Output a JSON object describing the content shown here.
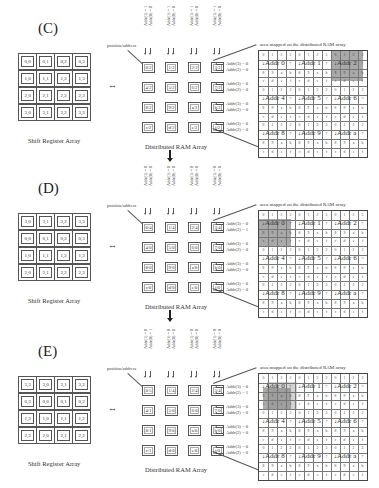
{
  "panels": [
    {
      "id": "C",
      "label": "(C)",
      "shift_register": {
        "caption": "Shift Register Array",
        "cells": [
          [
            "0,0",
            "0,1",
            "0,2",
            "0,3"
          ],
          [
            "1,0",
            "1,1",
            "1,2",
            "1,3"
          ],
          [
            "2,0",
            "2,1",
            "2,2",
            "2,3"
          ],
          [
            "3,0",
            "3,1",
            "3,2",
            "3,3"
          ]
        ]
      },
      "arrow": "↔",
      "ram": {
        "caption": "Distributed RAM Array",
        "position_label": "position/address",
        "col_labels": [
          [
            "Addr(1) = 1",
            "Addr(0) = 0"
          ],
          [
            "Addr(1) = 1",
            "Addr(0) = 0"
          ],
          [
            "Addr(1) = 1",
            "Addr(0) = 0"
          ],
          [
            "Addr(1) = 1",
            "Addr(0) = 0"
          ]
        ],
        "cells": [
          [
            "0/2",
            "1/2",
            "2/2",
            "3/2"
          ],
          [
            "4/2",
            "5/2",
            "6/2",
            "7/2"
          ],
          [
            "8/2",
            "9/2",
            "a/2",
            "b/2"
          ],
          [
            "c/2",
            "d/2",
            "e/2",
            "f/2"
          ]
        ],
        "row_labels": [
          [
            "Addr(3) = 0",
            "Addr(2) = 0"
          ],
          [
            "Addr(3) = 0",
            "Addr(2) = 0"
          ],
          [
            "Addr(3) = 0",
            "Addr(2) = 0"
          ],
          [
            "Addr(3) = 0",
            "Addr(2) = 0"
          ]
        ]
      },
      "mapped": {
        "title": "area mapped on the distributed RAM array",
        "addr_labels": [
          "Addr 0",
          "Addr 1",
          "Addr 2",
          "Addr 4",
          "Addr 5",
          "Addr 6",
          "Addr 8",
          "Addr 9",
          "Addr a"
        ],
        "highlight": "Addr 2 block"
      }
    },
    {
      "id": "D",
      "label": "(D)",
      "shift_register": {
        "caption": "Shift Register Array",
        "cells": [
          [
            "3,0",
            "3,1",
            "3,2",
            "3,3"
          ],
          [
            "0,0",
            "0,1",
            "0,2",
            "0,3"
          ],
          [
            "1,0",
            "1,1",
            "1,2",
            "1,3"
          ],
          [
            "2,0",
            "2,1",
            "2,2",
            "2,3"
          ]
        ]
      },
      "arrow": "↔",
      "ram": {
        "caption": "Distributed RAM Array",
        "position_label": "position/address",
        "col_labels": [
          [
            "Addr(1) = 0",
            "Addr(0) = 0"
          ],
          [
            "Addr(1) = 0",
            "Addr(0) = 0"
          ],
          [
            "Addr(1) = 0",
            "Addr(0) = 0"
          ],
          [
            "Addr(1) = 0",
            "Addr(0) = 0"
          ]
        ],
        "cells": [
          [
            "0/4",
            "1/4",
            "2/4",
            "3/4"
          ],
          [
            "4/0",
            "5/0",
            "6/0",
            "7/0"
          ],
          [
            "8/0",
            "9/0",
            "a/0",
            "b/0"
          ],
          [
            "c/0",
            "d/0",
            "e/0",
            "f/0"
          ]
        ],
        "row_labels": [
          [
            "Addr(3) = 0",
            "Addr(2) = 1"
          ],
          [
            "Addr(3) = 0",
            "Addr(2) = 0"
          ],
          [
            "Addr(3) = 0",
            "Addr(2) = 0"
          ],
          [
            "Addr(3) = 0",
            "Addr(2) = 0"
          ]
        ]
      },
      "mapped": {
        "title": "area mapped on the distributed RAM array",
        "addr_labels": [
          "Addr 0",
          "Addr 1",
          "Addr 2",
          "Addr 4",
          "Addr 5",
          "Addr 6",
          "Addr 8",
          "Addr 9",
          "Addr a"
        ],
        "highlight": "Addr 0 block shifted down"
      }
    },
    {
      "id": "E",
      "label": "(E)",
      "shift_register": {
        "caption": "Shift Register Array",
        "cells": [
          [
            "3,3",
            "3,0",
            "3,1",
            "3,2"
          ],
          [
            "0,3",
            "0,0",
            "0,1",
            "0,2"
          ],
          [
            "1,3",
            "1,0",
            "1,1",
            "1,2"
          ],
          [
            "2,3",
            "2,0",
            "2,1",
            "2,2"
          ]
        ]
      },
      "arrow": "↔",
      "ram": {
        "caption": "Distributed RAM Array",
        "position_label": "position/address",
        "col_labels": [
          [
            "Addr(1) = 0",
            "Addr(0) = 1"
          ],
          [
            "Addr(1) = 0",
            "Addr(0) = 0"
          ],
          [
            "Addr(1) = 0",
            "Addr(0) = 0"
          ],
          [
            "Addr(1) = 0",
            "Addr(0) = 0"
          ]
        ],
        "cells": [
          [
            "0/5",
            "1/4",
            "2/4",
            "3/4"
          ],
          [
            "4/1",
            "5/0",
            "6/0",
            "7/0"
          ],
          [
            "8/1",
            "9/0",
            "a/0",
            "b/0"
          ],
          [
            "c/1",
            "d/0",
            "e/0",
            "f/0"
          ]
        ],
        "row_labels": [
          [
            "Addr(3) = 0",
            "Addr(2) = 1"
          ],
          [
            "Addr(3) = 0",
            "Addr(2) = 0"
          ],
          [
            "Addr(3) = 0",
            "Addr(2) = 0"
          ],
          [
            "Addr(3) = 0",
            "Addr(2) = 0"
          ]
        ]
      },
      "mapped": {
        "title": "area mapped on the distributed RAM array",
        "addr_labels": [
          "Addr 0",
          "Addr 1",
          "Addr 2",
          "Addr 4",
          "Addr 5",
          "Addr 6",
          "Addr 8",
          "Addr 9",
          "Addr a"
        ],
        "highlight": "Addr 0 block shifted down-left"
      }
    }
  ],
  "grid_rows": [
    [
      "0",
      "1",
      "2",
      "3",
      "0",
      "1",
      "2",
      "3",
      "0",
      "1",
      "2",
      "3"
    ],
    [
      "4",
      "",
      "",
      "7",
      "4",
      "",
      "",
      "7",
      "4",
      "",
      "",
      "7"
    ],
    [
      "8",
      "9",
      "a",
      "b",
      "8",
      "9",
      "a",
      "b",
      "8",
      "9",
      "a",
      "b"
    ],
    [
      "c",
      "d",
      "e",
      "f",
      "c",
      "d",
      "e",
      "f",
      "c",
      "d",
      "e",
      "f"
    ]
  ],
  "between_arrow": "↓"
}
